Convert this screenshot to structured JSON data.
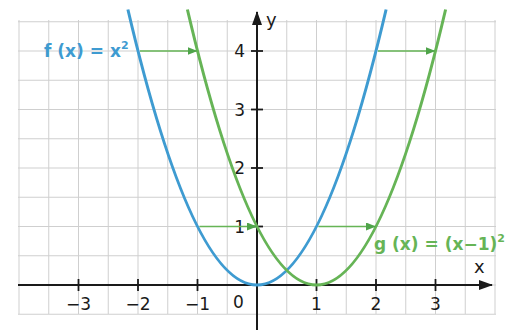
{
  "chart_data": {
    "type": "line",
    "title": "",
    "xlabel": "x",
    "ylabel": "y",
    "xlim": [
      -4,
      3.9
    ],
    "ylim": [
      -0.5,
      4.6
    ],
    "grid": true,
    "grid_step": 0.5,
    "x_ticks": [
      -3,
      -2,
      -1,
      1,
      2,
      3
    ],
    "x_tick_labels": [
      "−3",
      "−2",
      "−1",
      "1",
      "2",
      "3"
    ],
    "y_ticks": [
      1,
      2,
      3,
      4
    ],
    "y_tick_labels": [
      "1",
      "2",
      "3",
      "4"
    ],
    "origin_label": "0",
    "series": [
      {
        "name": "f(x) = x²",
        "label": "f (x) = x",
        "label_exponent": "2",
        "color": "#3e9bd1",
        "x": [
          -2,
          -1,
          0,
          1,
          2
        ],
        "y": [
          4,
          1,
          0,
          1,
          4
        ]
      },
      {
        "name": "g(x) = (x−1)²",
        "label": "g (x) = (x−1)",
        "label_exponent": "2",
        "color": "#66b456",
        "x": [
          -1,
          0,
          1,
          2,
          3
        ],
        "y": [
          4,
          1,
          0,
          1,
          4
        ]
      }
    ],
    "annotations": [
      {
        "type": "arrow",
        "from": [
          -2,
          4
        ],
        "to": [
          -1,
          4
        ],
        "color": "#66b456"
      },
      {
        "type": "arrow",
        "from": [
          2,
          4
        ],
        "to": [
          3,
          4
        ],
        "color": "#66b456"
      },
      {
        "type": "arrow",
        "from": [
          -1,
          1
        ],
        "to": [
          0,
          1
        ],
        "color": "#66b456"
      },
      {
        "type": "arrow",
        "from": [
          1,
          1
        ],
        "to": [
          2,
          1
        ],
        "color": "#66b456"
      }
    ]
  },
  "colors": {
    "f_curve": "#3e9bd1",
    "g_curve": "#66b456",
    "grid": "#cfcfcf",
    "axis": "#1a1a1a"
  }
}
